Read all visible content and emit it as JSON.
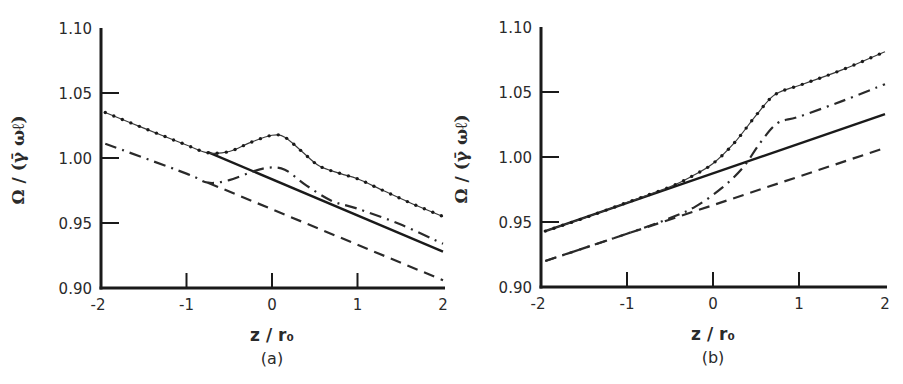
{
  "chart_data": [
    {
      "type": "line",
      "panel": "(a)",
      "caption": "(a)",
      "xlabel": "z / r₀",
      "ylabel": "Ω / (γ̄ ωℓ)",
      "xlim": [
        -2,
        2
      ],
      "ylim": [
        0.9,
        1.1
      ],
      "xticks": [
        "-2",
        "-1",
        "0",
        "1",
        "2"
      ],
      "yticks": [
        "0.90",
        "0.95",
        "1.00",
        "1.05",
        "1.10"
      ],
      "grid": false,
      "legend": "none",
      "series": [
        {
          "name": "dotted",
          "style": "dotted",
          "x": [
            -1.95,
            -1.5,
            -1.0,
            -0.75,
            -0.5,
            -0.25,
            0.0,
            0.15,
            0.35,
            0.55,
            0.8,
            1.0,
            1.3,
            1.6,
            2.0
          ],
          "y": [
            1.035,
            1.023,
            1.01,
            1.004,
            1.005,
            1.012,
            1.0175,
            1.016,
            1.005,
            0.994,
            0.988,
            0.984,
            0.975,
            0.966,
            0.955
          ]
        },
        {
          "name": "solid",
          "style": "solid",
          "x": [
            -0.75,
            2.0
          ],
          "y": [
            1.0045,
            0.928
          ]
        },
        {
          "name": "dash-dot",
          "style": "dashdot",
          "x": [
            -1.95,
            -1.0,
            -0.75,
            -0.5,
            -0.25,
            -0.05,
            0.15,
            0.4,
            0.7,
            1.0,
            1.5,
            2.0
          ],
          "y": [
            1.011,
            0.988,
            0.981,
            0.983,
            0.989,
            0.9925,
            0.991,
            0.979,
            0.967,
            0.961,
            0.949,
            0.934
          ]
        },
        {
          "name": "dashed",
          "style": "dashed",
          "x": [
            -0.75,
            2.0
          ],
          "y": [
            0.981,
            0.906
          ]
        }
      ]
    },
    {
      "type": "line",
      "panel": "(b)",
      "caption": "(b)",
      "xlabel": "z / r₀",
      "ylabel": "Ω / (γ̄ ωℓ)",
      "xlim": [
        -2,
        2
      ],
      "ylim": [
        0.9,
        1.1
      ],
      "xticks": [
        "-2",
        "-1",
        "0",
        "1",
        "2"
      ],
      "yticks": [
        "0.90",
        "0.95",
        "1.00",
        "1.05",
        "1.10"
      ],
      "grid": false,
      "legend": "none",
      "series": [
        {
          "name": "dotted",
          "style": "dotted",
          "x": [
            -1.95,
            -1.5,
            -1.0,
            -0.5,
            -0.25,
            0.0,
            0.25,
            0.5,
            0.7,
            0.9,
            1.0,
            1.5,
            2.0
          ],
          "y": [
            0.943,
            0.953,
            0.965,
            0.977,
            0.985,
            0.995,
            1.011,
            1.032,
            1.047,
            1.053,
            1.055,
            1.067,
            1.081
          ]
        },
        {
          "name": "solid",
          "style": "solid",
          "x": [
            -1.95,
            2.0
          ],
          "y": [
            0.943,
            1.033
          ]
        },
        {
          "name": "dash-dot",
          "style": "dashdot",
          "x": [
            -1.95,
            -1.0,
            -0.5,
            -0.2,
            0.1,
            0.35,
            0.55,
            0.75,
            1.0,
            1.5,
            2.0
          ],
          "y": [
            0.92,
            0.941,
            0.953,
            0.962,
            0.976,
            0.992,
            1.011,
            1.026,
            1.031,
            1.043,
            1.056
          ]
        },
        {
          "name": "dashed",
          "style": "dashed",
          "x": [
            -1.95,
            2.0
          ],
          "y": [
            0.92,
            1.007
          ]
        }
      ]
    }
  ]
}
